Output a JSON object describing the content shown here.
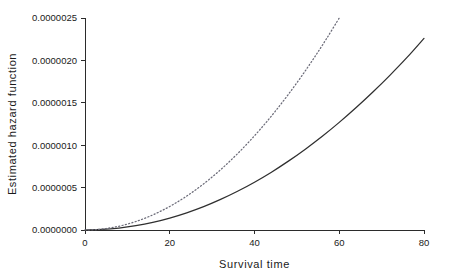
{
  "chart_data": {
    "type": "line",
    "title": "",
    "xlabel": "Survival time",
    "ylabel": "Estimated hazard function",
    "xlim": [
      0,
      80
    ],
    "ylim": [
      0.0,
      2.5e-06
    ],
    "xticks": [
      0,
      20,
      40,
      60,
      80
    ],
    "xticklabels": [
      "0",
      "20",
      "40",
      "60",
      "80"
    ],
    "yticks": [
      0.0,
      5e-07,
      1e-06,
      1.5e-06,
      2e-06,
      2.5e-06
    ],
    "yticklabels": [
      "0.0000000",
      "0.0000005",
      "0.0000010",
      "0.0000015",
      "0.0000020",
      "0.0000025"
    ],
    "grid": false,
    "legend": null,
    "series": [
      {
        "name": "solid-hazard-curve",
        "style": "solid",
        "color": "#2f2f2f",
        "x": [
          0,
          4,
          8,
          12,
          16,
          20,
          24,
          28,
          32,
          36,
          40,
          44,
          48,
          52,
          56,
          60,
          64,
          68,
          72,
          76,
          80
        ],
        "y": [
          0.0,
          6e-09,
          2.3e-08,
          5.1e-08,
          9e-08,
          1.41e-07,
          2.03e-07,
          2.76e-07,
          3.61e-07,
          4.57e-07,
          5.64e-07,
          6.82e-07,
          8.12e-07,
          9.53e-07,
          1.105e-06,
          1.269e-06,
          1.444e-06,
          1.63e-06,
          1.827e-06,
          2.035e-06,
          2.26e-06
        ]
      },
      {
        "name": "dotted-hazard-curve",
        "style": "dotted",
        "color": "#6b6b78",
        "x": [
          0,
          3,
          6,
          9,
          12,
          15,
          18,
          21,
          24,
          27,
          30,
          33,
          36,
          39,
          42,
          45,
          48,
          51,
          54,
          57,
          60
        ],
        "y": [
          0.0,
          6.3e-09,
          2.5e-08,
          5.63e-08,
          1e-07,
          1.563e-07,
          2.25e-07,
          3.063e-07,
          4e-07,
          5.063e-07,
          6.25e-07,
          7.563e-07,
          9e-07,
          1.0563e-06,
          1.225e-06,
          1.4063e-06,
          1.6e-06,
          1.8063e-06,
          2.025e-06,
          2.2563e-06,
          2.5e-06
        ]
      }
    ]
  }
}
